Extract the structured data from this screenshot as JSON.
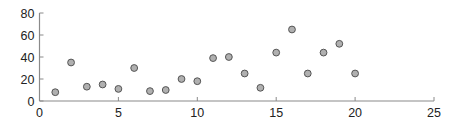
{
  "chart_data": {
    "type": "scatter",
    "title": "",
    "xlabel": "",
    "ylabel": "",
    "xlim": [
      0,
      25
    ],
    "ylim": [
      0,
      80
    ],
    "xticks": [
      0,
      5,
      10,
      15,
      20,
      25
    ],
    "yticks": [
      0,
      20,
      40,
      60,
      80
    ],
    "xtick_labels": [
      "0",
      "5",
      "10",
      "15",
      "20",
      "25"
    ],
    "ytick_labels": [
      "0",
      "20",
      "40",
      "60",
      "80"
    ],
    "grid": false,
    "legend": null,
    "series": [
      {
        "name": "data",
        "marker_fill": "#b0b0b0",
        "marker_edge": "#555555",
        "x": [
          1,
          2,
          3,
          4,
          5,
          6,
          7,
          8,
          9,
          10,
          11,
          12,
          13,
          14,
          15,
          16,
          17,
          18,
          19,
          20
        ],
        "y": [
          8,
          35,
          13,
          15,
          11,
          30,
          9,
          10,
          20,
          18,
          39,
          40,
          25,
          12,
          44,
          65,
          25,
          44,
          52,
          25
        ]
      }
    ]
  }
}
